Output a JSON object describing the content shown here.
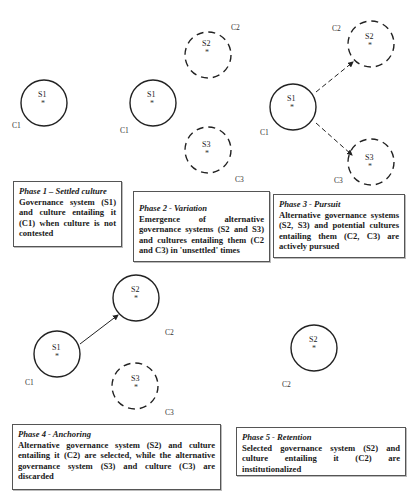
{
  "phases": [
    {
      "id": "phase1",
      "title": "Phase 1 – Settled culture",
      "body": "Governance system (S1) and culture entailing it (C1) when culture is not contested",
      "nodes": [
        {
          "system": "S1",
          "culture": "C1",
          "style": "solid",
          "marker": "*"
        }
      ]
    },
    {
      "id": "phase2",
      "title": "Phase 2 - Variation",
      "body": "Emergence of alternative governance systems (S2 and S3) and cultures entailing them (C2 and C3) in 'unsettled' times",
      "nodes": [
        {
          "system": "S1",
          "culture": "C1",
          "style": "solid",
          "marker": "*"
        },
        {
          "system": "S2",
          "culture": "C2",
          "style": "dashed",
          "marker": "*"
        },
        {
          "system": "S3",
          "culture": "C3",
          "style": "dashed",
          "marker": "*"
        }
      ]
    },
    {
      "id": "phase3",
      "title": "Phase 3 - Pursuit",
      "body": "Alternative governance systems (S2, S3) and potential cultures entailing them (C2, C3) are actively pursued",
      "nodes": [
        {
          "system": "S1",
          "culture": "C1",
          "style": "solid",
          "marker": "*"
        },
        {
          "system": "S2",
          "culture": "C2",
          "style": "dashed",
          "marker": "*"
        },
        {
          "system": "S3",
          "culture": "C3",
          "style": "dashed",
          "marker": "*"
        }
      ],
      "edges": [
        {
          "from": "S1",
          "to": "S2",
          "style": "dashed-arrow"
        },
        {
          "from": "S1",
          "to": "S3",
          "style": "dashed-arrow"
        }
      ]
    },
    {
      "id": "phase4",
      "title": "Phase 4 - Anchoring",
      "body": "Alternative governance system (S2) and culture entailing it (C2) are selected, while the alternative governance system (S3) and culture (C3) are discarded",
      "nodes": [
        {
          "system": "S1",
          "culture": "C1",
          "style": "solid",
          "marker": "*"
        },
        {
          "system": "S2",
          "culture": "C2",
          "style": "solid",
          "marker": "*"
        },
        {
          "system": "S3",
          "culture": "C3",
          "style": "dashed",
          "marker": "*"
        }
      ],
      "edges": [
        {
          "from": "S1",
          "to": "S2",
          "style": "solid-arrow"
        }
      ]
    },
    {
      "id": "phase5",
      "title": "Phase 5 - Retention",
      "body": "Selected governance system (S2) and culture entailing it (C2) are institutionalized",
      "nodes": [
        {
          "system": "S2",
          "culture": "C2",
          "style": "solid",
          "marker": "*"
        }
      ]
    }
  ]
}
